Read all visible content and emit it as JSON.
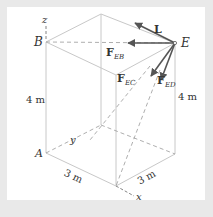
{
  "diagram": {
    "points": {
      "B": "B",
      "E": "E",
      "A": "A"
    },
    "axes": {
      "x": "x",
      "y": "y",
      "z": "z"
    },
    "dimensions": {
      "left_height": "4 m",
      "right_height": "4 m",
      "bottom_left": "3 m",
      "bottom_right": "3 m"
    },
    "forces": {
      "L": "L",
      "FEB_main": "F",
      "FEB_sub": "EB",
      "FEC_main": "F",
      "FEC_sub": "EC",
      "FED_main": "F",
      "FED_sub": "ED"
    },
    "colors": {
      "edge": "#c8c8c8",
      "arrow": "#555555",
      "text": "#333333",
      "border": "#e9e9e9"
    }
  }
}
